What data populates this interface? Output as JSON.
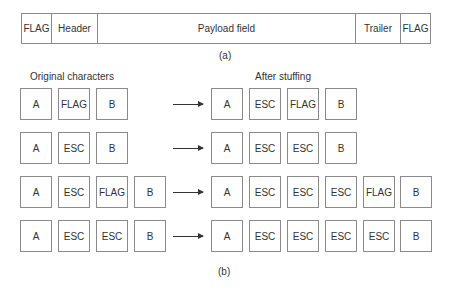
{
  "frame": {
    "segments": [
      {
        "label": "FLAG",
        "width": 30
      },
      {
        "label": "Header",
        "width": 46
      },
      {
        "label": "Payload field",
        "width": 258
      },
      {
        "label": "Trailer",
        "width": 45
      },
      {
        "label": "FLAG",
        "width": 31
      }
    ],
    "caption": "(a)"
  },
  "stuffing": {
    "original_label": "Original characters",
    "after_label": "After stuffing",
    "caption": "(b)",
    "rows": [
      {
        "original": [
          "A",
          "FLAG",
          "B"
        ],
        "stuffed": [
          "A",
          "ESC",
          "FLAG",
          "B"
        ]
      },
      {
        "original": [
          "A",
          "ESC",
          "B"
        ],
        "stuffed": [
          "A",
          "ESC",
          "ESC",
          "B"
        ]
      },
      {
        "original": [
          "A",
          "ESC",
          "FLAG",
          "B"
        ],
        "stuffed": [
          "A",
          "ESC",
          "ESC",
          "ESC",
          "FLAG",
          "B"
        ]
      },
      {
        "original": [
          "A",
          "ESC",
          "ESC",
          "B"
        ],
        "stuffed": [
          "A",
          "ESC",
          "ESC",
          "ESC",
          "ESC",
          "B"
        ]
      }
    ]
  }
}
